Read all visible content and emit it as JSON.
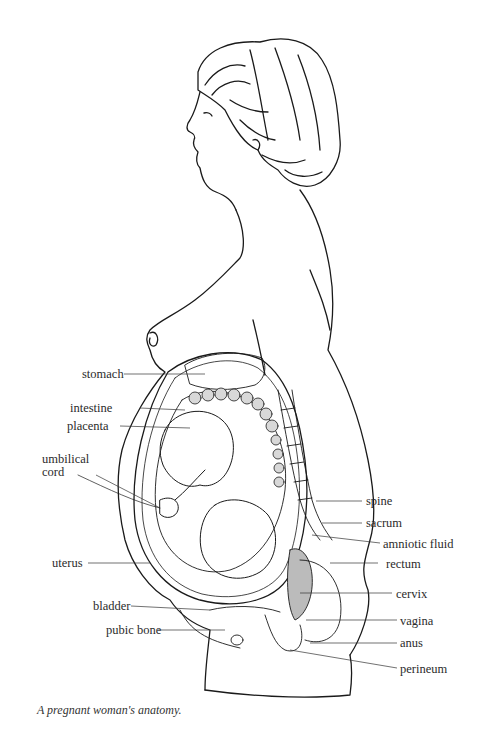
{
  "figure": {
    "caption": "A pregnant woman's anatomy.",
    "labels_left": [
      {
        "id": "stomach",
        "text": "stomach"
      },
      {
        "id": "intestine",
        "text": "intestine"
      },
      {
        "id": "placenta",
        "text": "placenta"
      },
      {
        "id": "umbilical-cord-1",
        "text": "umbilical"
      },
      {
        "id": "umbilical-cord-2",
        "text": "cord"
      },
      {
        "id": "uterus",
        "text": "uterus"
      },
      {
        "id": "bladder",
        "text": "bladder"
      },
      {
        "id": "pubic-bone",
        "text": "pubic bone"
      }
    ],
    "labels_right": [
      {
        "id": "spine",
        "text": "spine"
      },
      {
        "id": "sacrum",
        "text": "sacrum"
      },
      {
        "id": "amniotic-fluid",
        "text": "amniotic fluid"
      },
      {
        "id": "rectum",
        "text": "rectum"
      },
      {
        "id": "cervix",
        "text": "cervix"
      },
      {
        "id": "vagina",
        "text": "vagina"
      },
      {
        "id": "anus",
        "text": "anus"
      },
      {
        "id": "perineum",
        "text": "perineum"
      }
    ]
  }
}
